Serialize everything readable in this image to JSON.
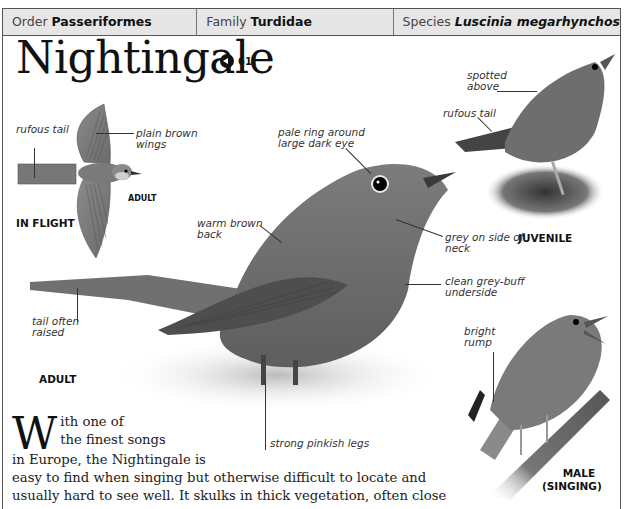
{
  "header": {
    "order": {
      "label": "Order",
      "value": "Passeriformes"
    },
    "family": {
      "label": "Family",
      "value": "Turdidae"
    },
    "species": {
      "label": "Species",
      "value": "Luscinia megarhynchos"
    }
  },
  "title": "Nightingale",
  "sound": {
    "icon": "speaker-icon",
    "track": "61"
  },
  "illustrations": {
    "flight": {
      "caption": "IN FLIGHT",
      "sub_caption": "ADULT",
      "notes": [
        "rufous tail",
        "plain brown wings"
      ]
    },
    "adult": {
      "caption": "ADULT",
      "notes": {
        "eye": "pale ring around large dark eye",
        "back": "warm brown back",
        "neck": "grey on side of neck",
        "underside": "clean grey-buff underside",
        "tail": "tail often raised",
        "legs": "strong pinkish legs"
      }
    },
    "juvenile": {
      "caption": "JUVENILE",
      "notes": [
        "spotted above",
        "rufous tail"
      ]
    },
    "male": {
      "caption_line1": "MALE",
      "caption_line2": "(SINGING)",
      "notes": [
        "bright rump"
      ]
    }
  },
  "body": {
    "drop_cap": "W",
    "line1": "ith one of",
    "line2": "the finest songs",
    "line3": "in Europe, the Nightingale is",
    "line4": "easy to find when singing but otherwise difficult to locate and",
    "line5": "usually hard to see well. It skulks in thick vegetation, often close"
  },
  "colors": {
    "header_bg": "#e6e6e6",
    "border": "#555555",
    "bird": "#6e6e6e",
    "text": "#222222"
  }
}
